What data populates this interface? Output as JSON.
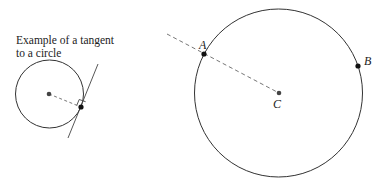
{
  "caption": {
    "line1": "Example of a tangent",
    "line2": "to a circle"
  },
  "labels": {
    "point_a": "A",
    "point_b": "B",
    "center_c": "C"
  },
  "colors": {
    "stroke": "#333333",
    "dashed": "#666666",
    "dot": "#111111",
    "center_dot": "#444444"
  }
}
